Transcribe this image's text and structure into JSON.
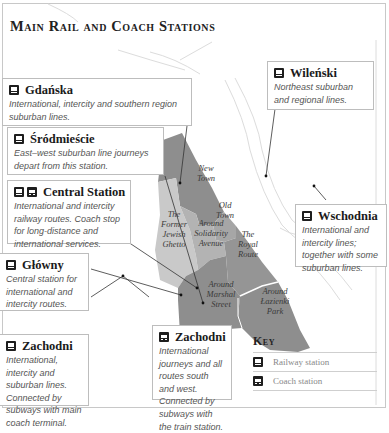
{
  "title": "Main Rail and Coach Stations",
  "colors": {
    "district_dark": "#8e8e8e",
    "district_mid": "#a8a8a8",
    "district_light": "#c9c9c9",
    "river_line": "#d6d6d6",
    "box_border": "#bdbdbd"
  },
  "stations": [
    {
      "id": "gdanska",
      "name": "Gdańska",
      "icons": [
        "railway-station"
      ],
      "description": "International, intercity and southern region suburban lines."
    },
    {
      "id": "wilenski",
      "name": "Wileński",
      "icons": [
        "railway-station"
      ],
      "description": "Northeast suburban and regional lines."
    },
    {
      "id": "srodmiescie",
      "name": "Śródmieście",
      "icons": [
        "railway-station"
      ],
      "description": "East–west suburban line journeys depart from this station."
    },
    {
      "id": "central",
      "name": "Central Station",
      "icons": [
        "railway-station",
        "coach-station"
      ],
      "description": "International and intercity railway routes. Coach stop for long-distance and international services."
    },
    {
      "id": "wschodnia",
      "name": "Wschodnia",
      "icons": [
        "railway-station"
      ],
      "description": "International and intercity lines; together with some suburban lines."
    },
    {
      "id": "glowny",
      "name": "Główny",
      "icons": [
        "railway-station"
      ],
      "description": "Central station for international and intercity routes."
    },
    {
      "id": "zachodni-rail",
      "name": "Zachodni",
      "icons": [
        "railway-station"
      ],
      "description": "International, intercity and suburban lines. Connected by subways with main coach terminal."
    },
    {
      "id": "zachodni-coach",
      "name": "Zachodni",
      "icons": [
        "coach-station"
      ],
      "description": "International journeys and all routes south and west. Connected by subways with the train station."
    }
  ],
  "districts": [
    {
      "id": "new-town",
      "label": "New Town"
    },
    {
      "id": "old-town",
      "label": "Old Town"
    },
    {
      "id": "former-jewish-ghetto",
      "label": "The Former Jewish Ghetto"
    },
    {
      "id": "solidarity-avenue",
      "label": "Around Solidarity Avenue"
    },
    {
      "id": "royal-route",
      "label": "The Royal Route"
    },
    {
      "id": "marshal-street",
      "label": "Around Marshal Street"
    },
    {
      "id": "lazienki-park",
      "label": "Around Łazienki Park"
    }
  ],
  "key": {
    "title": "Key",
    "items": [
      {
        "icon": "railway-station",
        "label": "Railway station"
      },
      {
        "icon": "coach-station",
        "label": "Coach station"
      }
    ]
  }
}
